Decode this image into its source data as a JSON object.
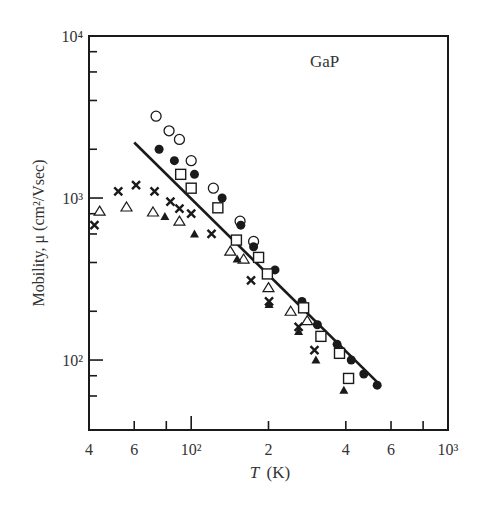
{
  "chart_data": {
    "type": "scatter",
    "title": "",
    "annotation": "GaP",
    "xlabel": "T (K)",
    "xlabel_italic": "T",
    "xlabel_unit": "(K)",
    "ylabel": "Mobility, μ (cm²/Vsec)",
    "xscale": "log",
    "yscale": "log",
    "xlim": [
      40,
      1000
    ],
    "ylim": [
      37,
      10000
    ],
    "grid": false,
    "legend": "none",
    "x_ticks": [
      {
        "value": 40,
        "label": "4",
        "major": true
      },
      {
        "value": 60,
        "label": "6",
        "major": true
      },
      {
        "value": 80,
        "label": "",
        "major": false
      },
      {
        "value": 100,
        "label": "10²",
        "major": true
      },
      {
        "value": 200,
        "label": "2",
        "major": true
      },
      {
        "value": 400,
        "label": "4",
        "major": true
      },
      {
        "value": 600,
        "label": "6",
        "major": true
      },
      {
        "value": 800,
        "label": "",
        "major": false
      },
      {
        "value": 1000,
        "label": "10³",
        "major": true
      }
    ],
    "y_ticks": [
      {
        "value": 10000,
        "label": "10⁴"
      },
      {
        "value": 8000,
        "label": ""
      },
      {
        "value": 6000,
        "label": ""
      },
      {
        "value": 4000,
        "label": ""
      },
      {
        "value": 2000,
        "label": ""
      },
      {
        "value": 1000,
        "label": "10³"
      },
      {
        "value": 800,
        "label": ""
      },
      {
        "value": 600,
        "label": ""
      },
      {
        "value": 400,
        "label": ""
      },
      {
        "value": 200,
        "label": ""
      },
      {
        "value": 100,
        "label": "10²"
      },
      {
        "value": 80,
        "label": ""
      },
      {
        "value": 60,
        "label": ""
      }
    ],
    "fit_line": {
      "x": [
        60,
        530
      ],
      "y": [
        2200,
        73
      ]
    },
    "series": [
      {
        "name": "open circles",
        "marker": "open-circle",
        "x": [
          73,
          82,
          90,
          100,
          122,
          155,
          175
        ],
        "y": [
          3200,
          2600,
          2300,
          1700,
          1150,
          720,
          540
        ]
      },
      {
        "name": "filled circles",
        "marker": "filled-circle",
        "x": [
          75,
          86,
          103,
          132,
          156,
          175,
          212,
          270,
          310,
          370,
          420,
          470,
          530
        ],
        "y": [
          2000,
          1700,
          1400,
          1000,
          680,
          500,
          360,
          230,
          165,
          125,
          100,
          82,
          70
        ]
      },
      {
        "name": "open squares",
        "marker": "open-square",
        "x": [
          91,
          100,
          127,
          150,
          183,
          198,
          274,
          320,
          378,
          410
        ],
        "y": [
          1400,
          1150,
          870,
          550,
          430,
          340,
          210,
          140,
          110,
          77
        ]
      },
      {
        "name": "crosses",
        "marker": "cross",
        "x": [
          42,
          52,
          61,
          72,
          83,
          90,
          100,
          120,
          171,
          201,
          262,
          302
        ],
        "y": [
          680,
          1100,
          1200,
          1100,
          950,
          860,
          800,
          600,
          310,
          230,
          160,
          115
        ]
      },
      {
        "name": "open triangles",
        "marker": "open-triangle",
        "x": [
          44,
          56,
          71,
          90,
          142,
          160,
          200,
          244,
          283
        ],
        "y": [
          830,
          880,
          820,
          720,
          470,
          420,
          280,
          200,
          175
        ]
      },
      {
        "name": "filled triangles",
        "marker": "filled-triangle",
        "x": [
          79,
          103,
          151,
          201,
          262,
          306,
          393
        ],
        "y": [
          770,
          600,
          420,
          220,
          150,
          100,
          65
        ]
      }
    ]
  }
}
